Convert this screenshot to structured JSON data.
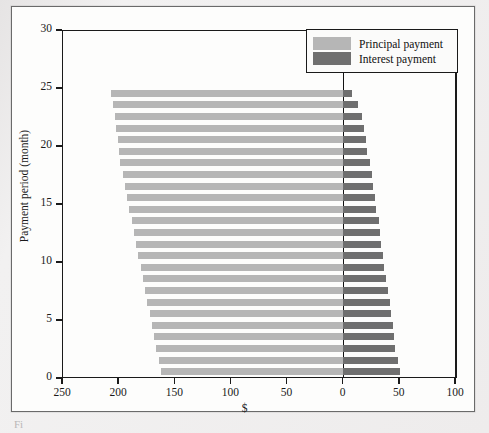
{
  "figure": {
    "caption_stub": "Fi",
    "background_color": "#eceaea",
    "plot_background": "#fdfdfc"
  },
  "legend": {
    "position": "top-right",
    "entries": [
      {
        "label": "Principal payment",
        "color": "#b6b6b6"
      },
      {
        "label": "Interest payment",
        "color": "#6f6f6f"
      }
    ]
  },
  "chart_data": {
    "type": "bar",
    "orientation": "horizontal",
    "title": "",
    "subtitle": "",
    "xlabel": "$",
    "ylabel": "Payment period (month)",
    "xlim": [
      -250,
      100
    ],
    "ylim": [
      0,
      30
    ],
    "grid": false,
    "legend_position": "top-right",
    "x_tick_values": [
      -250,
      -200,
      -150,
      -100,
      -50,
      0,
      50,
      100
    ],
    "x_tick_labels": [
      "250",
      "200",
      "150",
      "100",
      "50",
      "0",
      "50",
      "100"
    ],
    "y_tick_values": [
      0,
      5,
      10,
      15,
      20,
      25,
      30
    ],
    "y_tick_labels": [
      "0",
      "5",
      "10",
      "15",
      "20",
      "25",
      "30"
    ],
    "note": "Diverging horizontal bar chart of loan amortization. Principal payment extends left of zero (plotted as negative dollars); interest payment extends right of zero (positive dollars).",
    "categories": [
      0,
      1,
      2,
      3,
      4,
      5,
      6,
      7,
      8,
      9,
      10,
      11,
      12,
      13,
      14,
      15,
      16,
      17,
      18,
      19,
      20,
      21,
      22,
      23,
      24
    ],
    "series": [
      {
        "name": "Principal payment",
        "color": "#b6b6b6",
        "direction": "left",
        "values": [
          162,
          164,
          166,
          168,
          170,
          172,
          174,
          176,
          178,
          180,
          182,
          184,
          186,
          188,
          190,
          192,
          194,
          196,
          198,
          199,
          200,
          202,
          203,
          205,
          206
        ]
      },
      {
        "name": "Interest payment",
        "color": "#6f6f6f",
        "direction": "right",
        "values": [
          51,
          49,
          47,
          46,
          45,
          43,
          42,
          40,
          39,
          37,
          36,
          34,
          33,
          32,
          30,
          29,
          27,
          26,
          24,
          22,
          21,
          19,
          17,
          14,
          8
        ]
      }
    ]
  }
}
